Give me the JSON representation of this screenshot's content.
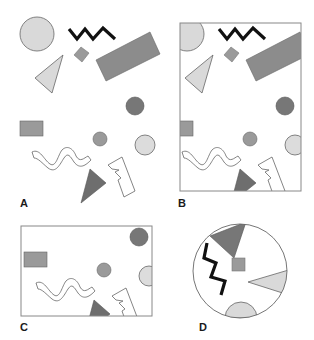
{
  "figure": {
    "panels": [
      {
        "id": "A",
        "label": "A",
        "description": "Original scene of shapes"
      },
      {
        "id": "B",
        "label": "B",
        "description": "Scene viewed through tall rectangular frame"
      },
      {
        "id": "C",
        "label": "C",
        "description": "Scene viewed through wide rectangular frame"
      },
      {
        "id": "D",
        "label": "D",
        "description": "Scene viewed through circular frame, rotated"
      }
    ],
    "shapes": [
      {
        "name": "large-light-circle",
        "type": "circle",
        "fill": "#d9d9d9"
      },
      {
        "name": "black-zigzag",
        "type": "polyline",
        "stroke": "#111111"
      },
      {
        "name": "small-rotated-square",
        "type": "polygon",
        "fill": "#9a9a9a"
      },
      {
        "name": "large-dark-rectangle",
        "type": "polygon",
        "fill": "#8c8c8c"
      },
      {
        "name": "light-triangle",
        "type": "polygon",
        "fill": "#d9d9d9"
      },
      {
        "name": "dark-circle",
        "type": "circle",
        "fill": "#777777"
      },
      {
        "name": "small-rectangle",
        "type": "rect",
        "fill": "#9a9a9a"
      },
      {
        "name": "medium-circle",
        "type": "circle",
        "fill": "#9a9a9a"
      },
      {
        "name": "light-circle",
        "type": "circle",
        "fill": "#dcdcdc"
      },
      {
        "name": "wavy-outline",
        "type": "path",
        "fill": "#ffffff"
      },
      {
        "name": "dark-triangle",
        "type": "polygon",
        "fill": "#6e6e6e"
      },
      {
        "name": "lightning-outline",
        "type": "polygon",
        "fill": "#ffffff"
      }
    ],
    "colors": {
      "light": "#d9d9d9",
      "medium": "#9a9a9a",
      "dark": "#777777",
      "outline": "#666666",
      "frame": "#888888"
    }
  }
}
